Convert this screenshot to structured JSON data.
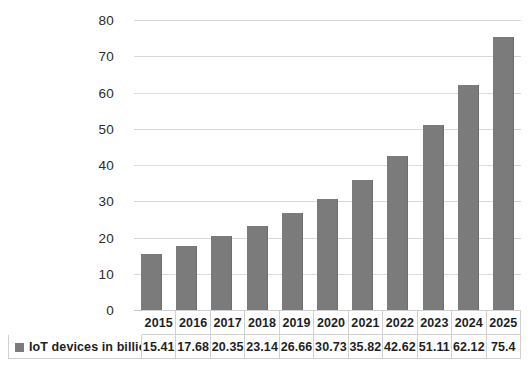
{
  "chart_data": {
    "type": "bar",
    "title": "",
    "xlabel": "",
    "ylabel": "",
    "categories": [
      "2015",
      "2016",
      "2017",
      "2018",
      "2019",
      "2020",
      "2021",
      "2022",
      "2023",
      "2024",
      "2025"
    ],
    "values": [
      15.41,
      17.68,
      20.35,
      23.14,
      26.66,
      30.73,
      35.82,
      42.62,
      51.11,
      62.12,
      75.4
    ],
    "series": [
      {
        "name": "IoT devices in billions",
        "values": [
          15.41,
          17.68,
          20.35,
          23.14,
          26.66,
          30.73,
          35.82,
          42.62,
          51.11,
          62.12,
          75.4
        ],
        "color": "#7b7b7b"
      }
    ],
    "ylim": [
      0,
      80
    ],
    "ytick_step": 10,
    "yticks": [
      "80",
      "70",
      "60",
      "50",
      "40",
      "30",
      "20",
      "10",
      "0"
    ],
    "grid": true,
    "legend_position": "bottom-table"
  },
  "legend": {
    "marker": "legend-swatch-gray",
    "label": "IoT devices in billions",
    "color": "#7b7b7b"
  },
  "table": {
    "row_label": "IoT devices in billions",
    "columns": [
      "2015",
      "2016",
      "2017",
      "2018",
      "2019",
      "2020",
      "2021",
      "2022",
      "2023",
      "2024",
      "2025"
    ],
    "values": [
      "15.41",
      "17.68",
      "20.35",
      "23.14",
      "26.66",
      "30.73",
      "35.82",
      "42.62",
      "51.11",
      "62.12",
      "75.4"
    ]
  },
  "colors": {
    "background": "#ffffff",
    "bar": "#7b7b7b",
    "gridline": "#d9d9d9",
    "table_border": "#d0d0d0",
    "text": "#1f1f1f"
  }
}
